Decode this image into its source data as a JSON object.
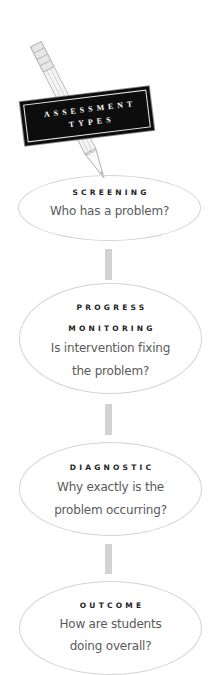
{
  "title": {
    "line1": "ASSESSMENT",
    "line2": "TYPES"
  },
  "icons": {
    "pencil": "pencil-icon"
  },
  "colors": {
    "label_bg": "#0d0d0d",
    "label_text": "#ffffff",
    "ellipse_border": "#d4d4d4",
    "connector": "#d2d2d2",
    "heading_text": "#222222",
    "question_text": "#5a5a5a"
  },
  "assessments": [
    {
      "heading_lines": [
        "SCREENING"
      ],
      "question_lines": [
        "Who has a problem?"
      ]
    },
    {
      "heading_lines": [
        "PROGRESS",
        "MONITORING"
      ],
      "question_lines": [
        "Is intervention fixing",
        "the problem?"
      ]
    },
    {
      "heading_lines": [
        "DIAGNOSTIC"
      ],
      "question_lines": [
        "Why exactly is the",
        "problem occurring?"
      ]
    },
    {
      "heading_lines": [
        "OUTCOME"
      ],
      "question_lines": [
        "How are students",
        "doing overall?"
      ]
    }
  ]
}
